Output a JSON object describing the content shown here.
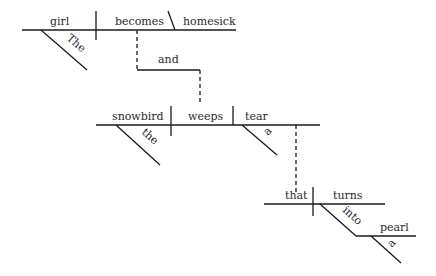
{
  "diagram": {
    "type": "Reed-Kellogg sentence diagram",
    "clause1": {
      "subject": "girl",
      "subject_modifier": "The",
      "verb": "becomes",
      "complement": "homesick"
    },
    "conjunction": "and",
    "clause2": {
      "subject": "snowbird",
      "subject_modifier": "the",
      "verb": "weeps",
      "object": "tear",
      "object_modifier": "a"
    },
    "relative_clause": {
      "subject": "that",
      "verb": "turns",
      "preposition": "into",
      "prep_object": "pearl",
      "prep_object_modifier": "a"
    }
  }
}
